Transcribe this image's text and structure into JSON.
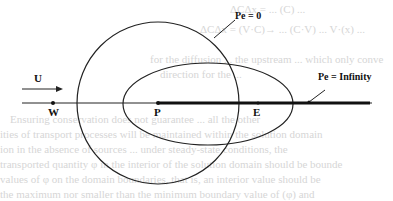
{
  "diagram": {
    "type": "concentration-isolines",
    "labels": {
      "flow": "U",
      "point_w": "W",
      "point_p": "P",
      "point_e": "E",
      "pe_zero": "Pe = 0",
      "pe_infinity": "Pe = Infinity"
    },
    "shapes": {
      "circle": {
        "cx": 158,
        "cy": 103,
        "r": 81,
        "meaning": "Pe = 0"
      },
      "ellipse": {
        "cx": 208,
        "cy": 104,
        "rx": 85,
        "ry": 41
      },
      "axis": {
        "x1": 22,
        "x2": 372,
        "y": 103
      },
      "thick_line": {
        "x1": 158,
        "x2": 370,
        "y": 103,
        "meaning": "Pe = Infinity"
      }
    },
    "colors": {
      "stroke": "#222222",
      "background": "#ffffff"
    }
  },
  "background_text": {
    "lines": [
      "ΔCΔx = ... (C) ...",
      "ΔCΔx = (V·C)→ ... (C·V) ... V·(x) ...",
      "for the diffusion ... the upstream ... which only conve",
      "direction for the ...",
      "Ensuring conservation does not guarantee ... all the other",
      "ities of transport processes will be maintained within the solution domain",
      "ion in the absence of sources ... under steady-state conditions, the",
      "transported quantity φ in the interior of the solution domain should be bounde",
      "values of φ on the domain boundaries, that is, an interior value should be",
      "the maximum nor smaller than the minimum boundary value of (φ) and"
    ]
  }
}
